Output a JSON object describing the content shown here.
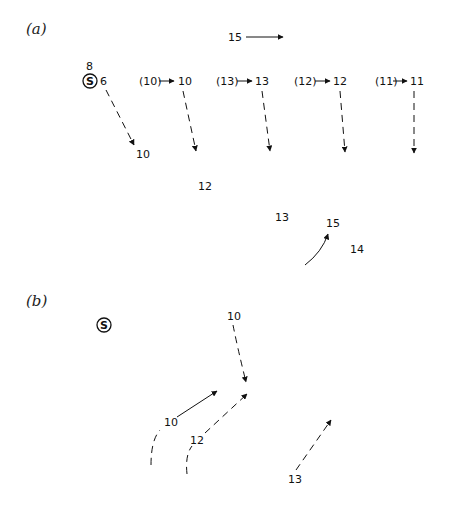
{
  "panels": [
    {
      "id": "a",
      "label": "(a)",
      "storm_marker": {
        "symbol": "S",
        "top_value": "8",
        "side_value": "6"
      },
      "steering_vector": {
        "value": "15"
      },
      "cell_labels": {
        "track1_end": "10",
        "pair2_old": "(10)",
        "pair2_new": "10",
        "pair3_old": "(13)",
        "pair3_new": "13",
        "pair4_old": "(12)",
        "pair4_new": "12",
        "pair5_old": "(11)",
        "pair5_new": "11",
        "scatter_12": "12",
        "scatter_13": "13",
        "scatter_15": "15",
        "scatter_14": "14"
      }
    },
    {
      "id": "b",
      "label": "(b)",
      "storm_marker": {
        "symbol": "S"
      },
      "cell_labels": {
        "top": "10",
        "left_track": "10",
        "mid_track": "12",
        "right_track": "13"
      }
    }
  ],
  "colors": {
    "ink": "#111111",
    "background": "#ffffff"
  }
}
